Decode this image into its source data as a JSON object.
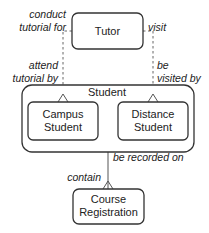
{
  "diagram": {
    "type": "entity-relationship",
    "entities": {
      "tutor": {
        "label": "Tutor"
      },
      "student": {
        "label": "Student"
      },
      "campus_student": {
        "line1": "Campus",
        "line2": "Student"
      },
      "distance_student": {
        "line1": "Distance",
        "line2": "Student"
      },
      "course_registration": {
        "line1": "Course",
        "line2": "Registration"
      }
    },
    "relationships": {
      "tutor_campus": {
        "from_label_line1": "conduct",
        "from_label_line2": "tutorial for",
        "to_label_line1": "attend",
        "to_label_line2": "tutorial by",
        "style": "dashed",
        "cardinality": "one-to-many"
      },
      "tutor_distance": {
        "from_label": "visit",
        "to_label_line1": "be",
        "to_label_line2": "visited by",
        "style": "dashed",
        "cardinality": "one-to-many"
      },
      "student_registration": {
        "from_label": "be recorded on",
        "to_label": "contain",
        "style": "solid",
        "cardinality": "one-to-many"
      }
    },
    "colors": {
      "stroke": "#333333",
      "text": "#222222",
      "background": "#ffffff"
    }
  }
}
